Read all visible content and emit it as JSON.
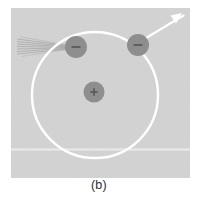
{
  "figure": {
    "caption": "(b)",
    "panel": {
      "x": 11,
      "y": 8,
      "width": 179,
      "height": 170,
      "fill": "#d3d3d3",
      "noise_band": {
        "y": 149,
        "height": 3,
        "fill": "#e2e2e2"
      }
    },
    "background_color": "#ffffff"
  },
  "chart_data": {
    "type": "diagram",
    "title": "(b)",
    "orbit": {
      "label": "electron-orbit",
      "center": [
        95,
        95
      ],
      "radius": 63,
      "stroke": "#ffffff",
      "stroke_width": 2.4,
      "fill": "none"
    },
    "particles": [
      {
        "name": "nucleus",
        "charge_symbol": "+",
        "center": [
          94,
          92
        ],
        "radius": 10.5,
        "fill": "#8e8e8e",
        "symbol_color": "#4a4a4a"
      },
      {
        "name": "electron-incident",
        "charge_symbol": "−",
        "center": [
          76,
          47
        ],
        "radius": 11,
        "fill": "#8e8e8e",
        "symbol_color": "#4a4a4a"
      },
      {
        "name": "electron-emitting",
        "charge_symbol": "−",
        "center": [
          138,
          45
        ],
        "radius": 11,
        "fill": "#8e8e8e",
        "symbol_color": "#4a4a4a"
      }
    ],
    "incoming_rays": {
      "name": "incident-beam",
      "count": 7,
      "stroke": "#9a9a9a",
      "stroke_width": 0.6,
      "target": [
        70,
        47
      ],
      "start_x": 17,
      "start_y_values": [
        39,
        41.5,
        44,
        46.5,
        49,
        51.5,
        54
      ]
    },
    "outgoing_arrow": {
      "name": "emitted-ray",
      "from": [
        146,
        38
      ],
      "to": [
        181,
        14
      ],
      "stroke": "#ffffff",
      "stroke_width": 2.2,
      "arrowhead": true
    },
    "legend": [],
    "xlabel": "",
    "ylabel": "",
    "grid": false
  }
}
